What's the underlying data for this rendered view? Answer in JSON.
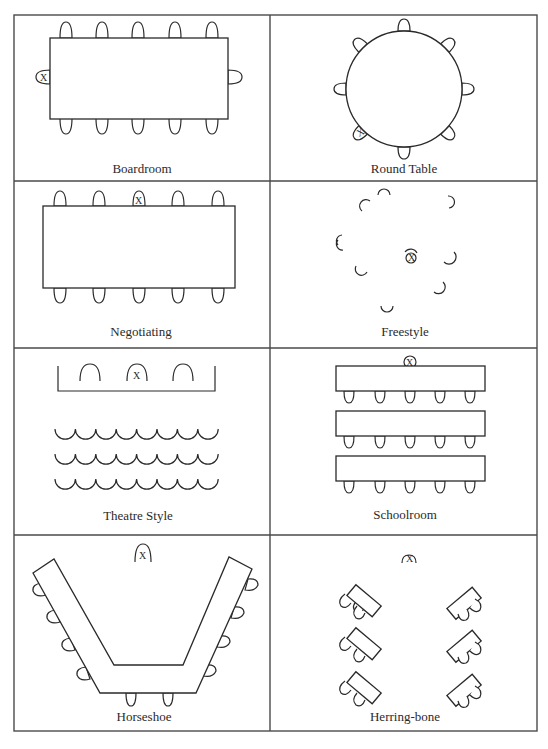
{
  "figure": {
    "panels": [
      {
        "id": "boardroom",
        "caption": "Boardroom",
        "chairs": 12,
        "chair_marked_x": "left end"
      },
      {
        "id": "round-table",
        "caption": "Round Table",
        "chairs": 8,
        "chair_marked_x": "lower left"
      },
      {
        "id": "negotiating",
        "caption": "Negotiating",
        "chairs": 10,
        "chair_marked_x": "top middle"
      },
      {
        "id": "freestyle",
        "caption": "Freestyle",
        "chairs": 9,
        "chair_marked_x": "center"
      },
      {
        "id": "theatre-style",
        "caption": "Theatre Style",
        "chairs": 27,
        "chair_marked_x": "front stage middle"
      },
      {
        "id": "schoolroom",
        "caption": "Schoolroom",
        "chairs": 15,
        "chair_marked_x": "front table middle"
      },
      {
        "id": "horseshoe",
        "caption": "Horseshoe",
        "chairs": 10,
        "chair_marked_x": "top center"
      },
      {
        "id": "herring-bone",
        "caption": "Herring-bone",
        "chairs": 12,
        "chair_marked_x": "top center"
      }
    ],
    "marker_label": "X"
  }
}
